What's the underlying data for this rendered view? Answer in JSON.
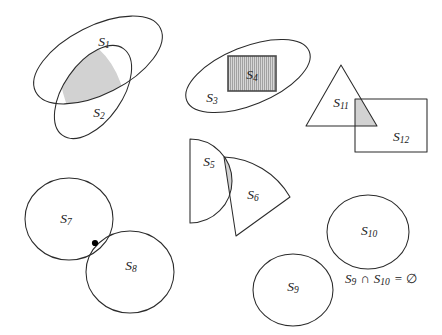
{
  "figure": {
    "background_color": "#ffffff",
    "outline_color": "#2b2b2b",
    "shade_color": "#d2d2d2",
    "hatch_color": "#6e6e6e",
    "dot_color": "#000000",
    "width": 442,
    "height": 335
  },
  "labels": {
    "s1": {
      "base": "S",
      "sub": "1"
    },
    "s2": {
      "base": "S",
      "sub": "2"
    },
    "s3": {
      "base": "S",
      "sub": "3"
    },
    "s4": {
      "base": "S",
      "sub": "4"
    },
    "s5": {
      "base": "S",
      "sub": "5"
    },
    "s6": {
      "base": "S",
      "sub": "6"
    },
    "s7": {
      "base": "S",
      "sub": "7"
    },
    "s8": {
      "base": "S",
      "sub": "8"
    },
    "s9": {
      "base": "S",
      "sub": "9"
    },
    "s10": {
      "base": "S",
      "sub": "10"
    },
    "s11": {
      "base": "S",
      "sub": "11"
    },
    "s12": {
      "base": "S",
      "sub": "12"
    }
  },
  "annotation": {
    "disjoint_statement": {
      "left_base": "S",
      "left_sub": "9",
      "operator": "∩",
      "right_base": "S",
      "right_sub": "10",
      "equals": "=",
      "result": "∅",
      "plain": "S9 ∩ S10 = ∅"
    }
  },
  "groups": [
    {
      "name": "overlapping-ellipses",
      "members": [
        "S1",
        "S2"
      ],
      "relation": "intersecting",
      "shaded": true
    },
    {
      "name": "containment",
      "members": [
        "S3",
        "S4"
      ],
      "relation": "S4 contained in S3",
      "shaded": false,
      "hatched": [
        "S4"
      ]
    },
    {
      "name": "overlapping-sectors",
      "members": [
        "S5",
        "S6"
      ],
      "relation": "intersecting",
      "shaded": true
    },
    {
      "name": "tangent-circles",
      "members": [
        "S7",
        "S8"
      ],
      "relation": "tangent at one point",
      "shaded": false
    },
    {
      "name": "disjoint-circles",
      "members": [
        "S9",
        "S10"
      ],
      "relation": "disjoint",
      "shaded": false
    },
    {
      "name": "triangle-rectangle",
      "members": [
        "S11",
        "S12"
      ],
      "relation": "intersecting",
      "shaded": true
    }
  ]
}
